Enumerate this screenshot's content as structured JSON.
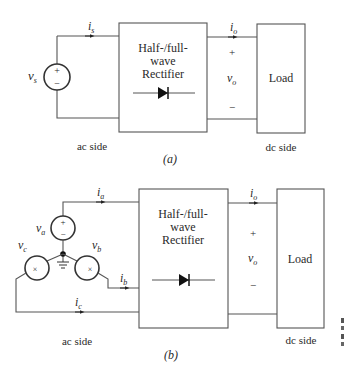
{
  "figure_a": {
    "caption": "(a)",
    "rectifier_label": [
      "Half-/full-",
      "wave",
      "Rectifier"
    ],
    "load_label": "Load",
    "ac_side_label": "ac side",
    "dc_side_label": "dc side",
    "source": {
      "symbol": "v",
      "subscript": "s",
      "plus": "+",
      "minus": "−"
    },
    "input_current": {
      "symbol": "i",
      "subscript": "s"
    },
    "output_current": {
      "symbol": "i",
      "subscript": "o"
    },
    "output_voltage": {
      "symbol": "v",
      "subscript": "o",
      "plus": "+",
      "minus": "−"
    }
  },
  "figure_b": {
    "caption": "(b)",
    "rectifier_label": [
      "Half-/full-",
      "wave",
      "Rectifier"
    ],
    "load_label": "Load",
    "ac_side_label": "ac side",
    "dc_side_label": "dc side",
    "sources": [
      {
        "symbol": "v",
        "subscript": "a",
        "plus": "+",
        "minus": "−"
      },
      {
        "symbol": "v",
        "subscript": "b"
      },
      {
        "symbol": "v",
        "subscript": "c"
      }
    ],
    "phase_currents": [
      {
        "symbol": "i",
        "subscript": "a"
      },
      {
        "symbol": "i",
        "subscript": "b"
      },
      {
        "symbol": "i",
        "subscript": "c"
      }
    ],
    "output_current": {
      "symbol": "i",
      "subscript": "o"
    },
    "output_voltage": {
      "symbol": "v",
      "subscript": "o",
      "plus": "+",
      "minus": "−"
    }
  },
  "colors": {
    "line": "#555555",
    "text": "#2a2a2a",
    "background": "#ffffff"
  }
}
